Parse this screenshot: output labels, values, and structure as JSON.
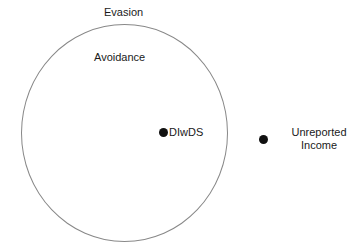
{
  "diagram": {
    "type": "venn-set",
    "background_color": "#ffffff",
    "regions": [
      {
        "id": "evasion",
        "label": "Evasion",
        "role": "outer-universe-label"
      },
      {
        "id": "avoidance",
        "label": "Avoidance",
        "role": "inner-set-label"
      }
    ],
    "shapes": [
      {
        "id": "set-boundary",
        "kind": "circle",
        "stroke_color": "#888888",
        "fill": "none"
      }
    ],
    "points": [
      {
        "id": "dlwds",
        "label": "DIwDS",
        "inside_circle": true,
        "marker_color": "#111111"
      },
      {
        "id": "unreported-income",
        "label": "Unreported Income",
        "label_line1": "Unreported",
        "label_line2": "Income",
        "inside_circle": false,
        "marker_color": "#111111"
      }
    ]
  }
}
